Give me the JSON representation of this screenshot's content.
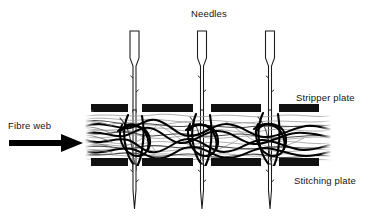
{
  "figure": {
    "labels": {
      "needles": "Needles",
      "stripper_plate": "Stripper plate",
      "stitching_plate": "Stitching plate",
      "fibre_web": "Fibre web"
    },
    "colors": {
      "ink": "#000000",
      "background": "#ffffff",
      "plate_fill": "#111111",
      "fibre_dark": "#000000",
      "fibre_light": "#8a8a8a",
      "needle_outline": "#1a1a1a",
      "text": "#151515"
    },
    "components": {
      "needles": {
        "icon": "needle-icon",
        "count": 3,
        "centers_x": [
          134.5,
          202,
          270
        ],
        "shank_top_y": 31,
        "shank_bottom_y": 57,
        "shank_width": 9,
        "blade_width": 2.6,
        "tip_y": 209,
        "barbs_per_needle": 4
      },
      "stripper_plate": {
        "icon": "plate-bar-icon",
        "y": 104,
        "height": 8,
        "segments": [
          {
            "x": 91,
            "width": 37
          },
          {
            "x": 142,
            "width": 51
          },
          {
            "x": 211,
            "width": 50
          },
          {
            "x": 279,
            "width": 40
          }
        ]
      },
      "stitching_plate": {
        "icon": "plate-bar-icon",
        "y": 158,
        "height": 8,
        "segments": [
          {
            "x": 91,
            "width": 37
          },
          {
            "x": 142,
            "width": 51
          },
          {
            "x": 211,
            "width": 50
          },
          {
            "x": 279,
            "width": 40
          }
        ]
      },
      "fibre_web": {
        "icon": "fibre-web-icon",
        "x_start": 86,
        "x_end": 330,
        "y_center": 137,
        "band_height": 48,
        "strand_count": 26
      },
      "flow_arrow": {
        "icon": "arrow-right-icon",
        "shaft_x": 9,
        "shaft_y": 140,
        "shaft_length": 54,
        "shaft_thickness": 6,
        "head_tip_x": 83,
        "head_half_height": 9
      }
    }
  }
}
